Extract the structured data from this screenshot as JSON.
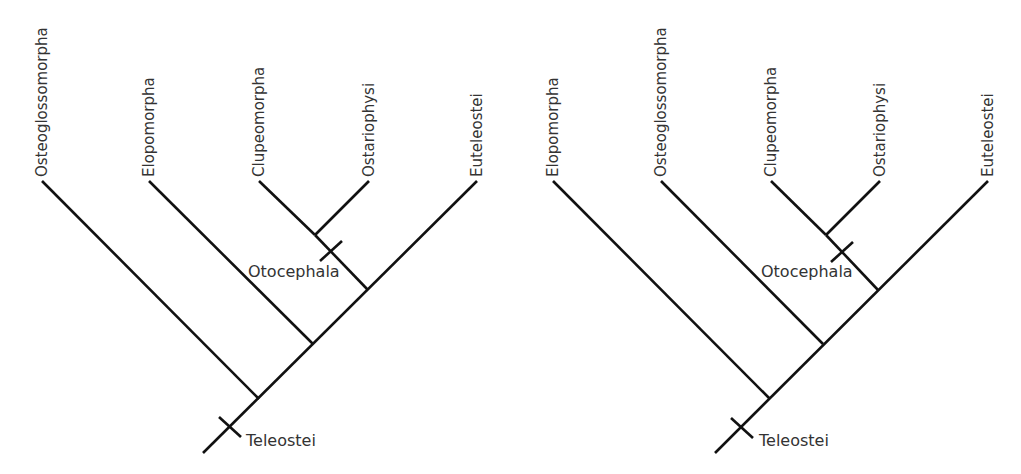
{
  "colors": {
    "line": "#111111",
    "text": "#333333",
    "background": "#ffffff"
  },
  "trees": [
    {
      "id": "left",
      "taxa": [
        {
          "label": "Osteoglossomorpha",
          "tip": [
            42,
            181
          ],
          "join": [
            259,
            399
          ]
        },
        {
          "label": "Elopomorpha",
          "tip": [
            149,
            181
          ],
          "join": [
            313,
            344
          ]
        },
        {
          "label": "Clupeomorpha",
          "tip": [
            259,
            181
          ],
          "join": [
            315,
            235
          ]
        },
        {
          "label": "Ostariophysi",
          "tip": [
            369,
            181
          ],
          "join": [
            315,
            235
          ]
        },
        {
          "label": "Euteleostei",
          "tip": [
            477,
            181
          ],
          "join": [
            203,
            453
          ]
        }
      ],
      "internal_branches": [
        {
          "from": [
            315,
            235
          ],
          "to": [
            368,
            290
          ]
        }
      ],
      "clades": [
        {
          "label": "Teleostei",
          "tick_center": [
            230,
            427
          ],
          "label_pos": [
            246,
            446
          ]
        },
        {
          "label": "Otocephala",
          "tick_center": [
            331,
            251
          ],
          "label_pos": [
            248,
            277
          ]
        }
      ]
    },
    {
      "id": "right",
      "taxa": [
        {
          "label": "Elopomorpha",
          "tip": [
            553,
            181
          ],
          "join": [
            770,
            399
          ]
        },
        {
          "label": "Osteoglossomorpha",
          "tip": [
            661,
            181
          ],
          "join": [
            823,
            344
          ]
        },
        {
          "label": "Clupeomorpha",
          "tip": [
            771,
            181
          ],
          "join": [
            826,
            235
          ]
        },
        {
          "label": "Ostariophysi",
          "tip": [
            880,
            181
          ],
          "join": [
            826,
            235
          ]
        },
        {
          "label": "Euteleostei",
          "tip": [
            988,
            181
          ],
          "join": [
            715,
            453
          ]
        }
      ],
      "internal_branches": [
        {
          "from": [
            826,
            235
          ],
          "to": [
            878,
            290
          ]
        }
      ],
      "clades": [
        {
          "label": "Teleostei",
          "tick_center": [
            742,
            428
          ],
          "label_pos": [
            759,
            446
          ]
        },
        {
          "label": "Otocephala",
          "tick_center": [
            842,
            252
          ],
          "label_pos": [
            761,
            277
          ]
        }
      ]
    }
  ]
}
